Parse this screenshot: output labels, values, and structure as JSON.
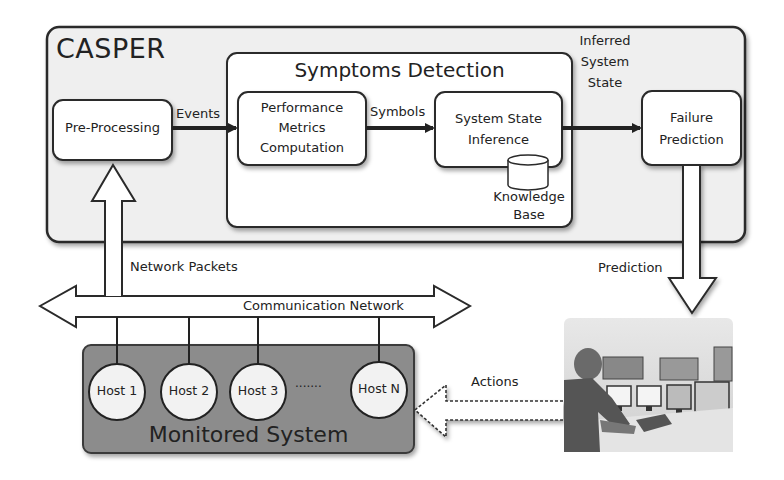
{
  "casper": {
    "title": "CASPER"
  },
  "symptoms_detection": {
    "title": "Symptoms Detection"
  },
  "nodes": {
    "pre_processing": "Pre-Processing",
    "performance_metrics": [
      "Performance",
      "Metrics",
      "Computation"
    ],
    "system_state_inference": [
      "System State",
      "Inference"
    ],
    "knowledge_base": [
      "Knowledge",
      "Base"
    ],
    "failure_prediction": [
      "Failure",
      "Prediction"
    ]
  },
  "edges": {
    "events": "Events",
    "symbols": "Symbols",
    "inferred_state": [
      "Inferred",
      "System",
      "State"
    ],
    "network_packets": "Network Packets",
    "communication_network": "Communication Network",
    "prediction": "Prediction",
    "actions": "Actions"
  },
  "monitored_system": {
    "title": "Monitored System",
    "hosts": [
      "Host 1",
      "Host 2",
      "Host 3",
      "Host N"
    ],
    "ellipsis": "·······"
  },
  "operator": {
    "icon": "operator-control-room-photo"
  },
  "colors": {
    "casper_bg": "#efefef",
    "box_bg": "#ffffff",
    "monitored_bg": "#8c8c8c",
    "stroke": "#2a2a2a"
  }
}
